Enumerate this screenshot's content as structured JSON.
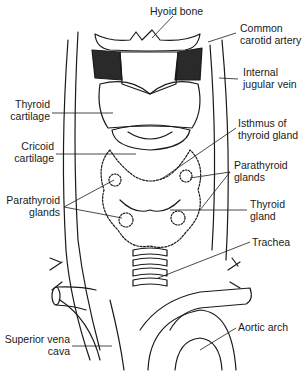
{
  "diagram": {
    "line_color": "#1a1a1a",
    "background": "#ffffff",
    "labels": [
      {
        "id": "hyoid-bone",
        "lines": [
          "Hyoid bone"
        ]
      },
      {
        "id": "common-carotid-artery",
        "lines": [
          "Common",
          "carotid artery"
        ]
      },
      {
        "id": "internal-jugular-vein",
        "lines": [
          "Internal",
          "jugular vein"
        ]
      },
      {
        "id": "thyroid-cartilage",
        "lines": [
          "Thyroid",
          "cartilage"
        ]
      },
      {
        "id": "isthmus-of-thyroid-gland",
        "lines": [
          "Isthmus of",
          "thyroid gland"
        ]
      },
      {
        "id": "cricoid-cartilage",
        "lines": [
          "Cricoid",
          "cartilage"
        ]
      },
      {
        "id": "parathyroid-glands-right",
        "lines": [
          "Parathyroid",
          "glands"
        ]
      },
      {
        "id": "parathyroid-glands-left",
        "lines": [
          "Parathyroid",
          "glands"
        ]
      },
      {
        "id": "thyroid-gland",
        "lines": [
          "Thyroid",
          "gland"
        ]
      },
      {
        "id": "trachea",
        "lines": [
          "Trachea"
        ]
      },
      {
        "id": "superior-vena-cava",
        "lines": [
          "Superior vena",
          "cava"
        ]
      },
      {
        "id": "aortic-arch",
        "lines": [
          "Aortic arch"
        ]
      }
    ]
  }
}
